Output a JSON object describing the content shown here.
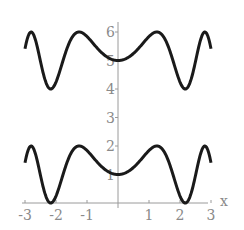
{
  "chart_data": {
    "type": "line",
    "title": "",
    "xlabel": "x",
    "ylabel": "",
    "xlim": [
      -3.1,
      3.1
    ],
    "ylim": [
      0,
      6.2
    ],
    "grid": false,
    "legend": null,
    "x_ticks": [
      "-3",
      "-2",
      "-1",
      "1",
      "2",
      "3"
    ],
    "y_ticks": [
      "1",
      "2",
      "3",
      "4",
      "5",
      "6"
    ],
    "series": [
      {
        "name": "1 + sin(x^2)",
        "formula": "1+sin(x^2)",
        "x_range": [
          -3,
          3
        ],
        "key_points": [
          [
            -2.8,
            2
          ],
          [
            -2.17,
            0
          ],
          [
            -1.25,
            2
          ],
          [
            0,
            1
          ],
          [
            1.25,
            2
          ],
          [
            2.17,
            0
          ],
          [
            2.8,
            2
          ]
        ]
      },
      {
        "name": "5 + sin(x^2)",
        "formula": "5+sin(x^2)",
        "x_range": [
          -3,
          3
        ],
        "key_points": [
          [
            -2.8,
            6
          ],
          [
            -2.17,
            4
          ],
          [
            -1.25,
            6
          ],
          [
            0,
            5
          ],
          [
            1.25,
            6
          ],
          [
            2.17,
            4
          ],
          [
            2.8,
            6
          ]
        ]
      }
    ],
    "colors": {
      "curve": "#1a1a1a",
      "axis": "#9a9a9a",
      "ticks": "#8a8a8a"
    }
  }
}
